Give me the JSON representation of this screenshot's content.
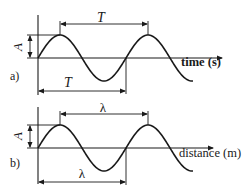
{
  "diagram": {
    "panels": [
      {
        "id": "a",
        "panel_label": "a)",
        "axis_label": "time (s)",
        "amplitude_label": "A",
        "period_label_top": "T",
        "period_label_bottom": "T"
      },
      {
        "id": "b",
        "panel_label": "b)",
        "axis_label": "distance (m)",
        "amplitude_label": "A",
        "period_label_top": "λ",
        "period_label_bottom": "λ"
      }
    ],
    "colors": {
      "ink": "#1a1a1a",
      "background": "#ffffff"
    }
  }
}
